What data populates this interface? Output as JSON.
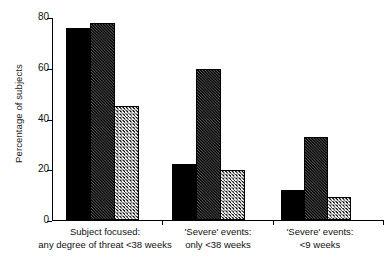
{
  "chart_data": {
    "type": "bar",
    "title": "",
    "xlabel": "",
    "ylabel": "Percentage of subjects",
    "ylim": [
      0,
      80
    ],
    "yticks": [
      0,
      20,
      40,
      60,
      80
    ],
    "ytick_labels": [
      "0",
      "20",
      "40",
      "60",
      "80"
    ],
    "grid": false,
    "legend": "none",
    "categories": [
      "Subject focused: any degree of threat <38 weeks",
      "'Severe' events: only <38 weeks",
      "'Severe' events: <9 weeks"
    ],
    "category_lines": [
      {
        "line1": "Subject focused:",
        "line2": "any degree of threat <38 weeks"
      },
      {
        "line1": "'Severe' events:",
        "line2": "only <38 weeks"
      },
      {
        "line1": "'Severe' events:",
        "line2": "<9 weeks"
      }
    ],
    "series": [
      {
        "name": "series-1-solid-black",
        "fill": "solid-black",
        "values": [
          76,
          22,
          12
        ]
      },
      {
        "name": "series-2-dark-hatched",
        "fill": "dark-hatched",
        "values": [
          78,
          60,
          33
        ]
      },
      {
        "name": "series-3-light-hatched",
        "fill": "light-hatched",
        "values": [
          45,
          20,
          9
        ]
      }
    ]
  },
  "colors": {
    "axis": "#000000",
    "series_1": "#000000",
    "series_2": "#141414",
    "series_3": "#ffffff",
    "background": "#ffffff"
  }
}
